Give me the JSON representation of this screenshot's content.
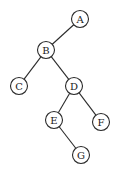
{
  "diagram": {
    "type": "binary-tree",
    "radius": 8.5,
    "nodes": [
      {
        "id": "A",
        "label": "A",
        "x": 80,
        "y": 19
      },
      {
        "id": "B",
        "label": "B",
        "x": 46,
        "y": 50
      },
      {
        "id": "C",
        "label": "C",
        "x": 19,
        "y": 86
      },
      {
        "id": "D",
        "label": "D",
        "x": 74,
        "y": 86
      },
      {
        "id": "E",
        "label": "E",
        "x": 54,
        "y": 120
      },
      {
        "id": "F",
        "label": "F",
        "x": 101,
        "y": 122
      },
      {
        "id": "G",
        "label": "G",
        "x": 81,
        "y": 155
      }
    ],
    "edges": [
      {
        "from": "A",
        "to": "B"
      },
      {
        "from": "B",
        "to": "C"
      },
      {
        "from": "B",
        "to": "D"
      },
      {
        "from": "D",
        "to": "E"
      },
      {
        "from": "D",
        "to": "F"
      },
      {
        "from": "E",
        "to": "G"
      }
    ]
  }
}
